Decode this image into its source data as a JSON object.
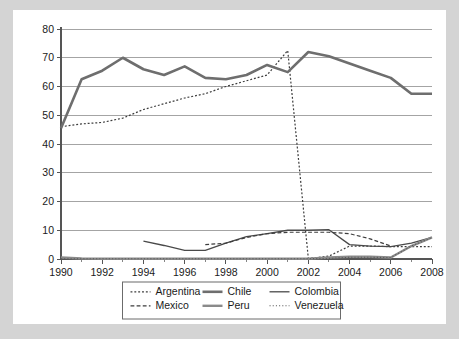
{
  "chart_data": {
    "type": "line",
    "title": "",
    "subtitle": "",
    "xlabel": "",
    "ylabel": "",
    "xlim": [
      1990,
      2008
    ],
    "ylim": [
      0,
      80
    ],
    "grid": true,
    "legend_position": "bottom",
    "x_tick_labels": [
      "1990",
      "1992",
      "1994",
      "1996",
      "1998",
      "2000",
      "2002",
      "2004",
      "2006",
      "2008"
    ],
    "x_tick_values": [
      1990,
      1992,
      1994,
      1996,
      1998,
      2000,
      2002,
      2004,
      2006,
      2008
    ],
    "y_tick_labels": [
      "0",
      "10",
      "20",
      "30",
      "40",
      "50",
      "60",
      "70",
      "80"
    ],
    "y_tick_values": [
      0,
      10,
      20,
      30,
      40,
      50,
      60,
      70,
      80
    ],
    "series": [
      {
        "name": "Argentina",
        "style": "dotted",
        "color": "#3d3d3d",
        "width": 1.2,
        "x": [
          1990,
          1991,
          1992,
          1993,
          1994,
          1995,
          1996,
          1997,
          1998,
          1999,
          2000,
          2001,
          2002,
          2003,
          2004,
          2005,
          2006,
          2007,
          2008
        ],
        "values": [
          46.0,
          47.0,
          47.5,
          49.0,
          52.0,
          54.0,
          56.0,
          57.5,
          60.0,
          62.0,
          64.0,
          72.5,
          0.2,
          1.0,
          4.5,
          4.5,
          4.3,
          4.3,
          4.3
        ]
      },
      {
        "name": "Chile",
        "style": "solid",
        "color": "#6e6e6e",
        "width": 2.6,
        "x": [
          1990,
          1991,
          1992,
          1993,
          1994,
          1995,
          1996,
          1997,
          1998,
          1999,
          2000,
          2001,
          2002,
          2003,
          2004,
          2005,
          2006,
          2007,
          2008
        ],
        "values": [
          45.5,
          62.5,
          65.5,
          70.0,
          66.0,
          64.0,
          67.0,
          63.0,
          62.5,
          64.0,
          67.5,
          65.0,
          72.0,
          70.5,
          68.0,
          65.5,
          63.0,
          57.5,
          57.5
        ]
      },
      {
        "name": "Colombia",
        "style": "solid",
        "color": "#4a4a4a",
        "width": 1.3,
        "x": [
          1994,
          1995,
          1996,
          1997,
          1998,
          1999,
          2000,
          2001,
          2002,
          2003,
          2004,
          2005,
          2006,
          2007,
          2008
        ],
        "values": [
          6.2,
          4.7,
          3.0,
          3.0,
          5.5,
          7.8,
          8.8,
          10.0,
          10.0,
          10.2,
          5.0,
          4.5,
          4.3,
          5.5,
          7.5
        ]
      },
      {
        "name": "Mexico",
        "style": "dashed",
        "color": "#3d3d3d",
        "width": 1.2,
        "x": [
          1997,
          1998,
          1999,
          2000,
          2001,
          2002,
          2003,
          2004,
          2005,
          2006
        ],
        "values": [
          5.0,
          5.5,
          7.5,
          8.8,
          9.3,
          9.3,
          9.3,
          8.8,
          7.0,
          4.5
        ]
      },
      {
        "name": "Peru",
        "style": "solid",
        "color": "#8a8a8a",
        "width": 2.4,
        "x": [
          1990,
          1991,
          1992,
          1993,
          1994,
          1995,
          1996,
          1997,
          1998,
          1999,
          2000,
          2001,
          2002,
          2003,
          2004,
          2005,
          2006,
          2007,
          2008
        ],
        "values": [
          0.5,
          0.2,
          0.1,
          0.1,
          0.1,
          0.1,
          0.1,
          0.1,
          0.1,
          0.1,
          0.1,
          0.1,
          0.1,
          0.5,
          0.8,
          0.8,
          0.5,
          4.5,
          7.5
        ]
      },
      {
        "name": "Venezuela",
        "style": "fine-dotted",
        "color": "#5a5a5a",
        "width": 1.1,
        "x": [
          1990,
          1992,
          1994,
          1996,
          1998,
          2000,
          2001,
          2002,
          2003,
          2004,
          2005,
          2006,
          2007,
          2008
        ],
        "values": [
          0.1,
          0.1,
          0.1,
          0.1,
          0.1,
          0.1,
          0.1,
          0.1,
          0.2,
          0.6,
          0.6,
          0.5,
          4.5,
          7.5
        ]
      }
    ]
  },
  "legend": {
    "entries": [
      {
        "label": "Argentina"
      },
      {
        "label": "Chile"
      },
      {
        "label": "Colombia"
      },
      {
        "label": "Mexico"
      },
      {
        "label": "Peru"
      },
      {
        "label": "Venezuela"
      }
    ]
  },
  "colors": {
    "background": "#d4d4d4",
    "panel": "#ffffff",
    "gridline": "#9a9a9a",
    "axis": "#555555",
    "text": "#1a1a1a"
  }
}
